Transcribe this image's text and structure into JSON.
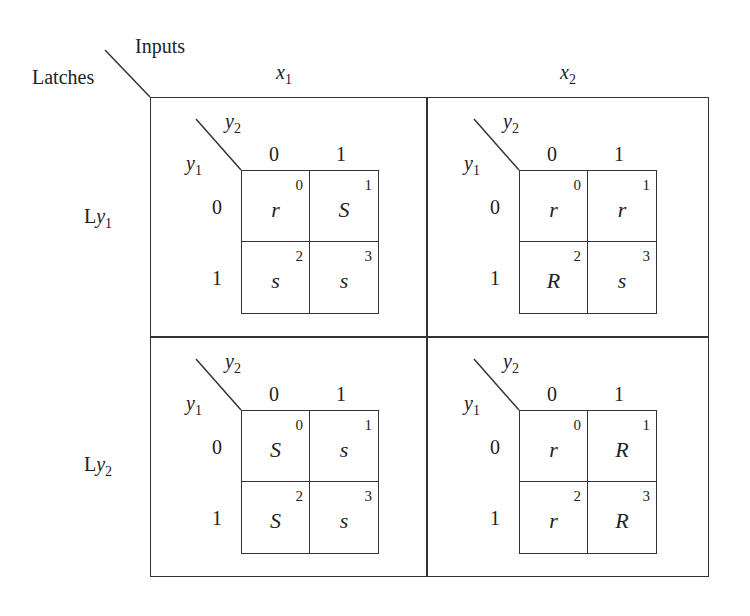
{
  "corner": {
    "top_label": "Inputs",
    "left_label": "Latches"
  },
  "columns": [
    {
      "var": "x",
      "sub": "1"
    },
    {
      "var": "x",
      "sub": "2"
    }
  ],
  "rows": [
    {
      "prefix": "L",
      "var": "y",
      "sub": "1"
    },
    {
      "prefix": "L",
      "var": "y",
      "sub": "2"
    }
  ],
  "kmap_axes": {
    "col_var": "y",
    "col_sub": "2",
    "row_var": "y",
    "row_sub": "1",
    "col_headers": [
      "0",
      "1"
    ],
    "row_headers": [
      "0",
      "1"
    ]
  },
  "maps": [
    {
      "name": "Ly1-x1",
      "cells": [
        {
          "value": "r",
          "index": "0"
        },
        {
          "value": "S",
          "index": "1"
        },
        {
          "value": "s",
          "index": "2"
        },
        {
          "value": "s",
          "index": "3"
        }
      ]
    },
    {
      "name": "Ly1-x2",
      "cells": [
        {
          "value": "r",
          "index": "0"
        },
        {
          "value": "r",
          "index": "1"
        },
        {
          "value": "R",
          "index": "2"
        },
        {
          "value": "s",
          "index": "3"
        }
      ]
    },
    {
      "name": "Ly2-x1",
      "cells": [
        {
          "value": "S",
          "index": "0"
        },
        {
          "value": "s",
          "index": "1"
        },
        {
          "value": "S",
          "index": "2"
        },
        {
          "value": "s",
          "index": "3"
        }
      ]
    },
    {
      "name": "Ly2-x2",
      "cells": [
        {
          "value": "r",
          "index": "0"
        },
        {
          "value": "R",
          "index": "1"
        },
        {
          "value": "r",
          "index": "2"
        },
        {
          "value": "R",
          "index": "3"
        }
      ]
    }
  ]
}
